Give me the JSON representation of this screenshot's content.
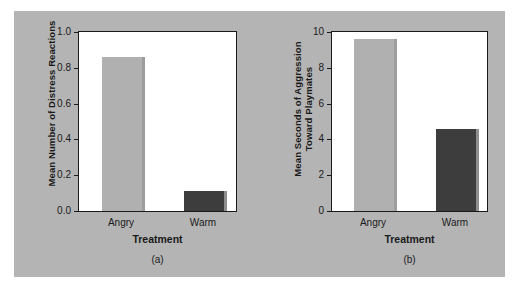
{
  "figure": {
    "background_color": "#b4b4b4",
    "page_background": "#ffffff"
  },
  "colors": {
    "bar_light": "#b0b0b0",
    "bar_dark": "#3d3d3d",
    "shadow": "#9d9d9d",
    "axis": "#1a1a1a",
    "plot_background": "#ffffff"
  },
  "chart_data": [
    {
      "type": "bar",
      "panel": "a",
      "title": "",
      "caption": "(a)",
      "xlabel": "Treatment",
      "ylabel": "Mean Number of Distress Reactions",
      "categories": [
        "Angry",
        "Warm"
      ],
      "values": [
        0.86,
        0.11
      ],
      "bar_colors": [
        "#b0b0b0",
        "#3d3d3d"
      ],
      "ylim": [
        0.0,
        1.0
      ],
      "yticks": [
        "0.0",
        "0.2",
        "0.4",
        "0.6",
        "0.8",
        "1.0"
      ],
      "ytick_values": [
        0.0,
        0.2,
        0.4,
        0.6,
        0.8,
        1.0
      ],
      "grid": false,
      "legend": "none"
    },
    {
      "type": "bar",
      "panel": "b",
      "title": "",
      "caption": "(b)",
      "xlabel": "Treatment",
      "ylabel": "Mean Seconds of Aggression\nToward Playmates",
      "categories": [
        "Angry",
        "Warm"
      ],
      "values": [
        9.6,
        4.6
      ],
      "bar_colors": [
        "#b0b0b0",
        "#3d3d3d"
      ],
      "ylim": [
        0,
        10
      ],
      "yticks": [
        "0",
        "2",
        "4",
        "6",
        "8",
        "10"
      ],
      "ytick_values": [
        0,
        2,
        4,
        6,
        8,
        10
      ],
      "grid": false,
      "legend": "none"
    }
  ]
}
